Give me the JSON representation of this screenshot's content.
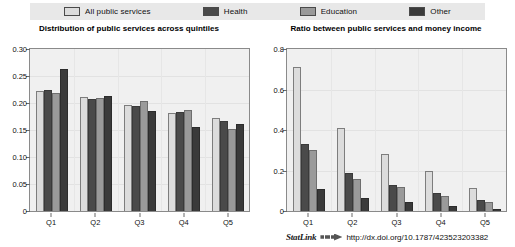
{
  "legend": {
    "entries": [
      {
        "label": "All public services",
        "color": "#dcdcdc",
        "icon": "legend-swatch-icon"
      },
      {
        "label": "Health",
        "color": "#4a4a4a",
        "icon": "legend-swatch-icon"
      },
      {
        "label": "Education",
        "color": "#9a9a9a",
        "icon": "legend-swatch-icon"
      },
      {
        "label": "Other",
        "color": "#3a3a3a",
        "icon": "legend-swatch-icon"
      }
    ]
  },
  "footer": {
    "statlink_word": "StatLink",
    "statlink_glyph": "arrow-bars-icon",
    "url": "http://dx.doi.org/10.1787/423523203382"
  },
  "chart_data": [
    {
      "type": "bar",
      "title": "Distribution of public services across quintiles",
      "xlabel": "",
      "ylabel": "",
      "categories": [
        "Q1",
        "Q2",
        "Q3",
        "Q4",
        "Q5"
      ],
      "yticks": [
        "0",
        "0.05",
        "0.10",
        "0.15",
        "0.20",
        "0.25",
        "0.30"
      ],
      "ytick_values": [
        0,
        0.05,
        0.1,
        0.15,
        0.2,
        0.25,
        0.3
      ],
      "ylim": [
        0,
        0.3
      ],
      "grid": true,
      "legend_position": "top",
      "series": [
        {
          "name": "All public services",
          "color": "#dcdcdc",
          "values": [
            0.223,
            0.212,
            0.196,
            0.182,
            0.172
          ]
        },
        {
          "name": "Health",
          "color": "#4a4a4a",
          "values": [
            0.224,
            0.207,
            0.195,
            0.183,
            0.166
          ]
        },
        {
          "name": "Education",
          "color": "#9a9a9a",
          "values": [
            0.218,
            0.21,
            0.204,
            0.187,
            0.152
          ]
        },
        {
          "name": "Other",
          "color": "#3a3a3a",
          "values": [
            0.263,
            0.213,
            0.186,
            0.156,
            0.161
          ]
        }
      ]
    },
    {
      "type": "bar",
      "title": "Ratio between public services and money income",
      "xlabel": "",
      "ylabel": "",
      "categories": [
        "Q1",
        "Q2",
        "Q3",
        "Q4",
        "Q5"
      ],
      "yticks": [
        "0",
        "0.2",
        "0.4",
        "0.6",
        "0.8"
      ],
      "ytick_values": [
        0,
        0.2,
        0.4,
        0.6,
        0.8
      ],
      "ylim": [
        0,
        0.8
      ],
      "grid": true,
      "legend_position": "top",
      "series": [
        {
          "name": "All public services",
          "color": "#dcdcdc",
          "values": [
            0.71,
            0.41,
            0.28,
            0.2,
            0.112
          ]
        },
        {
          "name": "Health",
          "color": "#4a4a4a",
          "values": [
            0.33,
            0.19,
            0.13,
            0.09,
            0.055
          ]
        },
        {
          "name": "Education",
          "color": "#9a9a9a",
          "values": [
            0.3,
            0.16,
            0.12,
            0.075,
            0.045
          ]
        },
        {
          "name": "Other",
          "color": "#3a3a3a",
          "values": [
            0.11,
            0.065,
            0.045,
            0.025,
            0.012
          ]
        }
      ]
    }
  ]
}
